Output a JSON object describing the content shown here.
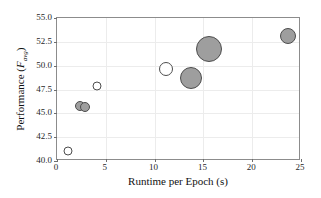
{
  "chart_data": {
    "type": "scatter",
    "title": "",
    "xlabel": "Runtime per Epoch (s)",
    "ylabel_prefix": "Performance (",
    "ylabel_symbol": "F",
    "ylabel_subscript": "avg",
    "ylabel_suffix": ")",
    "ylabel": "Performance (F_avg)",
    "xlim": [
      0,
      25
    ],
    "ylim": [
      40.0,
      55.0
    ],
    "xticks": [
      "0",
      "5",
      "10",
      "15",
      "20",
      "25"
    ],
    "xtick_values": [
      0,
      5,
      10,
      15,
      20,
      25
    ],
    "yticks": [
      "40.0",
      "42.5",
      "45.0",
      "47.5",
      "50.0",
      "52.5",
      "55.0"
    ],
    "ytick_values": [
      40.0,
      42.5,
      45.0,
      47.5,
      50.0,
      52.5,
      55.0
    ],
    "grid": true,
    "legend": "none",
    "marker_fill_filled": "#9e9e9e",
    "marker_fill_open": "#ffffff",
    "marker_edge": "#4d4d4d",
    "frame_color": "#8c8c8c",
    "grid_color": "#ececec",
    "background": "#ffffff",
    "size_encodes": "model size",
    "points": [
      {
        "x": 1.1,
        "y": 41.1,
        "size": 9,
        "filled": false
      },
      {
        "x": 2.4,
        "y": 45.75,
        "size": 10,
        "filled": true
      },
      {
        "x": 2.9,
        "y": 45.7,
        "size": 10,
        "filled": true
      },
      {
        "x": 4.1,
        "y": 47.9,
        "size": 9,
        "filled": false
      },
      {
        "x": 11.2,
        "y": 49.65,
        "size": 14,
        "filled": false
      },
      {
        "x": 13.7,
        "y": 48.7,
        "size": 22,
        "filled": true
      },
      {
        "x": 15.6,
        "y": 51.7,
        "size": 26,
        "filled": true
      },
      {
        "x": 23.7,
        "y": 53.1,
        "size": 16,
        "filled": true
      }
    ]
  }
}
